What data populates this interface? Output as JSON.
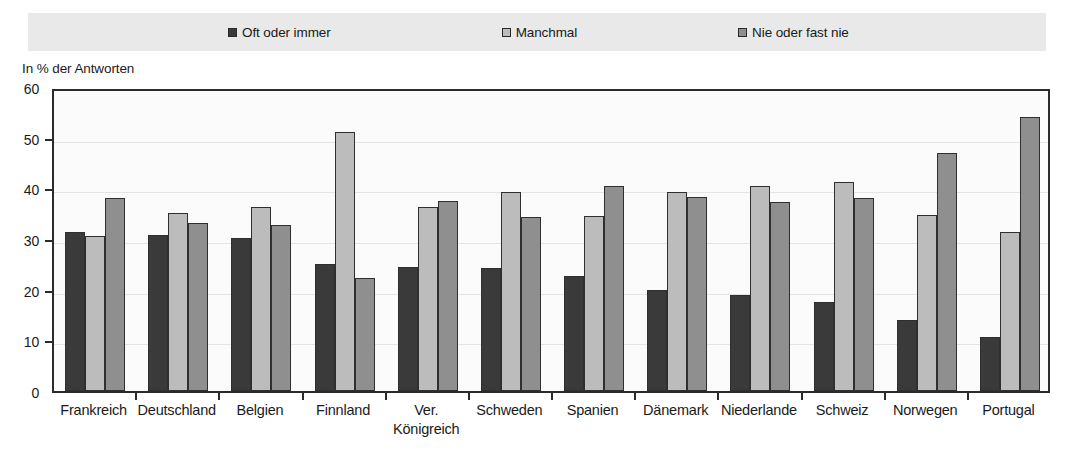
{
  "axis_title": "In % der Antworten",
  "legend": {
    "items": [
      {
        "label": "Oft oder immer",
        "color": "#3a3a3a",
        "icon": "square-swatch-icon"
      },
      {
        "label": "Manchmal",
        "color": "#bcbcbc",
        "icon": "square-swatch-icon"
      },
      {
        "label": "Nie oder fast nie",
        "color": "#8f8f8f",
        "icon": "square-swatch-icon"
      }
    ]
  },
  "y_ticks": [
    "0",
    "10",
    "20",
    "30",
    "40",
    "50",
    "60"
  ],
  "chart_data": {
    "type": "bar",
    "title": "",
    "xlabel": "",
    "ylabel": "In % der Antworten",
    "ylim": [
      0,
      60
    ],
    "ytick_step": 10,
    "grid": true,
    "legend_position": "top",
    "categories": [
      "Frankreich",
      "Deutschland",
      "Belgien",
      "Finnland",
      "Ver.\nKönigreich",
      "Schweden",
      "Spanien",
      "Dänemark",
      "Niederlande",
      "Schweiz",
      "Norwegen",
      "Portugal"
    ],
    "series": [
      {
        "name": "Oft oder immer",
        "color": "#3a3a3a",
        "values": [
          31.4,
          30.7,
          30.2,
          25.0,
          24.4,
          24.3,
          22.7,
          19.9,
          19.0,
          17.6,
          14.1,
          10.6
        ]
      },
      {
        "name": "Manchmal",
        "color": "#bcbcbc",
        "values": [
          30.5,
          35.2,
          36.4,
          51.2,
          36.3,
          39.3,
          34.5,
          39.3,
          40.5,
          41.2,
          34.8,
          31.4
        ]
      },
      {
        "name": "Nie oder fast nie",
        "color": "#8f8f8f",
        "values": [
          38.0,
          33.2,
          32.7,
          22.3,
          37.6,
          34.3,
          40.5,
          38.2,
          37.3,
          38.1,
          47.0,
          54.0
        ]
      }
    ]
  }
}
